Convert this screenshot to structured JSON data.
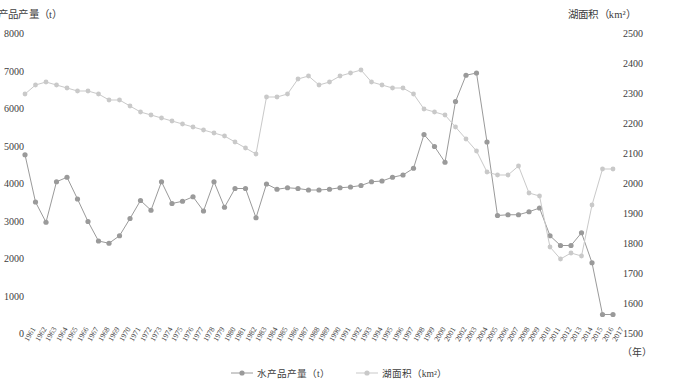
{
  "axes": {
    "left_title": "产品产量（t）",
    "right_title": "湖面积（km²）",
    "x_unit": "（年）",
    "left_ticks": [
      "8000",
      "7000",
      "6000",
      "5000",
      "4000",
      "3000",
      "2000",
      "1000",
      "0"
    ],
    "right_ticks": [
      "2500",
      "2400",
      "2300",
      "2200",
      "2100",
      "2000",
      "1900",
      "1800",
      "1700",
      "1600",
      "1500"
    ]
  },
  "legend": {
    "items": [
      {
        "label": "水产品产量（t）",
        "color": "#9a9a9a"
      },
      {
        "label": "湖面积（km²）",
        "color": "#c9c9c9"
      }
    ]
  },
  "chart_data": {
    "type": "line",
    "title": "",
    "xlabel": "（年）",
    "ylabel": "产品产量（t）",
    "y2label": "湖面积（km²）",
    "ylim": [
      0,
      8000
    ],
    "y2lim": [
      1500,
      2500
    ],
    "grid": false,
    "legend_position": "bottom",
    "categories": [
      "1961",
      "1962",
      "1963",
      "1964",
      "1965",
      "1966",
      "1967",
      "1968",
      "1969",
      "1970",
      "1971",
      "1972",
      "1973",
      "1974",
      "1975",
      "1976",
      "1977",
      "1978",
      "1979",
      "1980",
      "1981",
      "1982",
      "1983",
      "1984",
      "1985",
      "1986",
      "1987",
      "1988",
      "1989",
      "1990",
      "1991",
      "1992",
      "1993",
      "1994",
      "1995",
      "1996",
      "1997",
      "1998",
      "1999",
      "2000",
      "2001",
      "2002",
      "2003",
      "2004",
      "2005",
      "2006",
      "2007",
      "2008",
      "2009",
      "2010",
      "2011",
      "2012",
      "2013",
      "2014",
      "2015",
      "2016",
      "2017"
    ],
    "series": [
      {
        "name": "水产品产量（t）",
        "axis": "left",
        "color": "#9a9a9a",
        "values": [
          4780,
          3520,
          2980,
          4060,
          4180,
          3600,
          3000,
          2480,
          2420,
          2620,
          3080,
          3560,
          3300,
          4060,
          3480,
          3540,
          3660,
          3280,
          4060,
          3380,
          3880,
          3880,
          3100,
          4000,
          3860,
          3900,
          3880,
          3840,
          3840,
          3860,
          3900,
          3920,
          3960,
          4060,
          4080,
          4180,
          4240,
          4420,
          5320,
          5000,
          4580,
          6200,
          6900,
          6960,
          5120,
          3160,
          3180,
          3180,
          3260,
          3360,
          2620,
          2360,
          2360,
          2700,
          1900,
          520,
          520
        ]
      },
      {
        "name": "湖面积（km²）",
        "axis": "right",
        "color": "#c9c9c9",
        "values": [
          2300,
          2330,
          2340,
          2330,
          2320,
          2310,
          2310,
          2300,
          2280,
          2280,
          2260,
          2240,
          2230,
          2220,
          2210,
          2200,
          2190,
          2180,
          2170,
          2160,
          2140,
          2120,
          2100,
          2290,
          2290,
          2300,
          2350,
          2360,
          2330,
          2340,
          2360,
          2370,
          2380,
          2340,
          2330,
          2320,
          2320,
          2300,
          2250,
          2240,
          2230,
          2190,
          2150,
          2110,
          2040,
          2030,
          2030,
          2060,
          1970,
          1960,
          1790,
          1750,
          1770,
          1760,
          1930,
          2050,
          2050
        ]
      }
    ]
  }
}
